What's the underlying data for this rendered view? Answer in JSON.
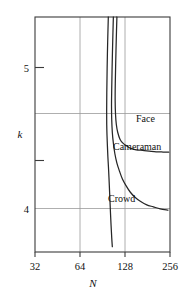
{
  "chart_data": {
    "type": "line",
    "title": "",
    "subtitle": "",
    "xlabel": "N",
    "ylabel": "k",
    "xscale": "log2",
    "xlim": [
      32,
      256
    ],
    "ylim": [
      3.78,
      5.55
    ],
    "grid": true,
    "legend_position": "inline-annotations",
    "x_ticks": [
      32,
      64,
      128,
      256
    ],
    "x_tick_labels": [
      "32",
      "64",
      "128",
      "256"
    ],
    "x_gridlines": [
      64,
      128
    ],
    "y_ticks": [
      5.0,
      4.7,
      4.35,
      4.0
    ],
    "y_tick_labels": [
      "5",
      "",
      "",
      "4"
    ],
    "y_gridlines": [
      4.7,
      4.0
    ],
    "annotations": [
      {
        "text": "Face",
        "x": 150,
        "y": 4.62
      },
      {
        "text": "Cameraman",
        "x": 128,
        "y": 4.42
      },
      {
        "text": "Crowd",
        "x": 110,
        "y": 4.18
      }
    ],
    "series": [
      {
        "name": "Face",
        "points": [
          [
            113.0,
            5.55
          ],
          [
            112.0,
            5.4
          ],
          [
            111.0,
            5.22
          ],
          [
            110.2,
            5.05
          ],
          [
            110.0,
            4.92
          ],
          [
            110.6,
            4.82
          ],
          [
            112.0,
            4.74
          ],
          [
            114.5,
            4.68
          ],
          [
            118.5,
            4.63
          ],
          [
            124.0,
            4.6
          ],
          [
            131.0,
            4.58
          ],
          [
            140.0,
            4.56
          ],
          [
            152.0,
            4.55
          ],
          [
            168.0,
            4.545
          ],
          [
            186.0,
            4.54
          ],
          [
            207.0,
            4.535
          ],
          [
            230.0,
            4.533
          ],
          [
            251.0,
            4.532
          ]
        ]
      },
      {
        "name": "Cameraman",
        "points": [
          [
            107.0,
            5.55
          ],
          [
            106.0,
            5.38
          ],
          [
            105.0,
            5.18
          ],
          [
            104.3,
            5.0
          ],
          [
            104.0,
            4.88
          ],
          [
            104.3,
            4.78
          ],
          [
            105.3,
            4.68
          ],
          [
            107.0,
            4.6
          ],
          [
            109.5,
            4.52
          ],
          [
            113.0,
            4.45
          ],
          [
            117.5,
            4.39
          ],
          [
            123.0,
            4.33
          ],
          [
            130.0,
            4.28
          ],
          [
            139.0,
            4.23
          ],
          [
            150.0,
            4.19
          ],
          [
            163.0,
            4.16
          ],
          [
            179.0,
            4.135
          ],
          [
            198.0,
            4.12
          ],
          [
            220.0,
            4.105
          ],
          [
            248.0,
            4.095
          ]
        ]
      },
      {
        "name": "Crowd",
        "points": [
          [
            99.0,
            5.55
          ],
          [
            98.0,
            5.36
          ],
          [
            97.2,
            5.16
          ],
          [
            96.7,
            4.98
          ],
          [
            96.5,
            4.84
          ],
          [
            96.6,
            4.74
          ],
          [
            97.0,
            4.66
          ],
          [
            97.6,
            4.58
          ],
          [
            98.3,
            4.5
          ],
          [
            99.2,
            4.42
          ],
          [
            100.0,
            4.34
          ],
          [
            100.8,
            4.25
          ],
          [
            101.6,
            4.16
          ],
          [
            102.4,
            4.07
          ],
          [
            103.3,
            3.98
          ],
          [
            104.3,
            3.89
          ],
          [
            105.3,
            3.82
          ]
        ]
      }
    ]
  },
  "axes": {
    "x_label": "N",
    "y_label": "k",
    "x_tick_32": "32",
    "x_tick_64": "64",
    "x_tick_128": "128",
    "x_tick_256": "256",
    "y_tick_5": "5",
    "y_tick_4": "4"
  },
  "series_labels": {
    "face": "Face",
    "cameraman": "Cameraman",
    "crowd": "Crowd"
  },
  "colors": {
    "curve": "#262626",
    "frame": "#3b3b3b",
    "grid": "#9a9a9a",
    "background": "#ffffff",
    "text": "#111111"
  }
}
